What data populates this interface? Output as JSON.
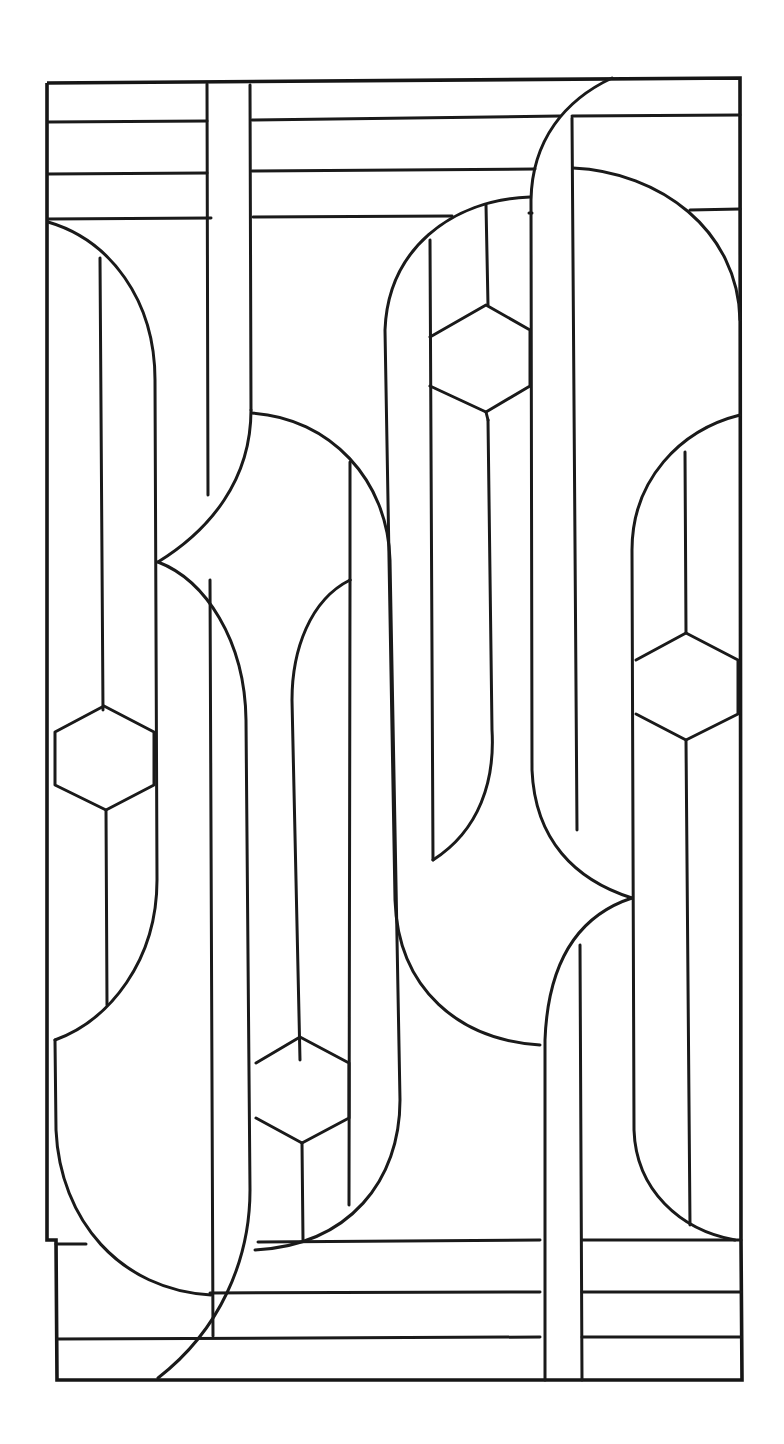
{
  "artwork": {
    "kind": "stained-glass line pattern",
    "background": "#ffffff",
    "line_color": "#1a1a1a"
  }
}
